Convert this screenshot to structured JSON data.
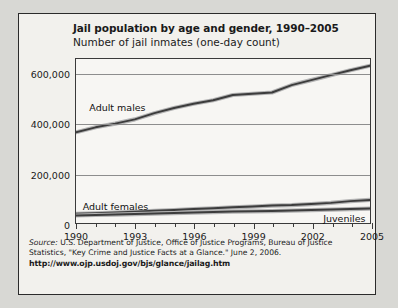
{
  "figure": {
    "title": "Jail population by age and gender, 1990–2005",
    "subtitle": "Number of jail inmates (one-day count)",
    "source_prefix": "Source:",
    "source_text": " U.S. Department of Justice, Office of Justice Programs, Bureau of Justice Statistics, \"Key Crime and Justice Facts at a Glance.\" June 2, 2006.",
    "url": "http://www.ojp.usdoj.gov/bjs/glance/jailag.htm"
  },
  "chart_data": {
    "type": "line",
    "title": "Jail population by age and gender, 1990–2005",
    "subtitle": "Number of jail inmates (one-day count)",
    "xlabel": "",
    "ylabel": "Number of jail inmates (one-day count)",
    "x": [
      1990,
      1991,
      1992,
      1993,
      1994,
      1995,
      1996,
      1997,
      1998,
      1999,
      2000,
      2001,
      2002,
      2003,
      2004,
      2005
    ],
    "xlim": [
      1990,
      2005
    ],
    "ylim": [
      0,
      660000
    ],
    "yticks": [
      0,
      200000,
      400000,
      600000
    ],
    "ytick_labels": [
      "0",
      "200,000",
      "400,000",
      "600,000"
    ],
    "xticks": [
      1990,
      1991,
      1992,
      1993,
      1994,
      1995,
      1996,
      1997,
      1998,
      1999,
      2000,
      2001,
      2002,
      2003,
      2004,
      2005
    ],
    "xtick_labels_major": [
      "1990",
      "1993",
      "1996",
      "1999",
      "2002",
      "2005"
    ],
    "grid": true,
    "legend_position": "inline-annotations",
    "series": [
      {
        "name": "Adult males",
        "label_x": 1992.1,
        "label_y": 468000,
        "values": [
          365000,
          385000,
          400000,
          417000,
          442000,
          463000,
          480000,
          494000,
          515000,
          520000,
          525000,
          555000,
          575000,
          595000,
          615000,
          633000
        ]
      },
      {
        "name": "Adult females",
        "label_x": 1992.0,
        "label_y": 76000,
        "values": [
          37000,
          39000,
          42000,
          45000,
          49000,
          52000,
          56000,
          59000,
          63000,
          66000,
          70000,
          72000,
          76000,
          81000,
          88000,
          93000
        ]
      },
      {
        "name": "Juveniles",
        "label_x": 2003.6,
        "label_y": 28000,
        "values": [
          30000,
          32000,
          34000,
          36000,
          38000,
          40000,
          42000,
          44000,
          46000,
          47000,
          48000,
          50000,
          52000,
          54000,
          56000,
          58000
        ]
      }
    ]
  }
}
